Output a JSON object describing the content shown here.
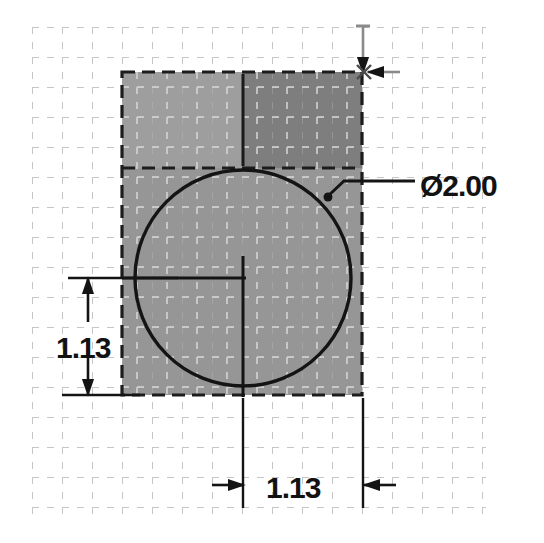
{
  "drawing": {
    "type": "cad-sketch",
    "title": "",
    "units": "inch",
    "background_color": "#ffffff",
    "grid": {
      "visible": true,
      "style": "dashed",
      "spacing_px": 30,
      "color": "#c9c9c9",
      "origin_x": 32,
      "origin_y": 27,
      "cols": 16,
      "rows": 17
    },
    "shapes": [
      {
        "name": "base-rectangle",
        "type": "rectangle",
        "x": 122,
        "y": 72,
        "width": 240,
        "height": 323,
        "edge_style": "dashed",
        "edge_color": "#1a1a1a",
        "bands": [
          {
            "name": "upper-left-band",
            "fill": "#9b9b9b",
            "x": 122,
            "y": 72,
            "width": 120,
            "height": 96
          },
          {
            "name": "upper-right-band",
            "fill": "#7d7d7d",
            "x": 242,
            "y": 72,
            "width": 120,
            "height": 96
          },
          {
            "name": "lower-band",
            "fill": "#949494",
            "x": 122,
            "y": 168,
            "width": 240,
            "height": 227
          }
        ]
      },
      {
        "name": "circle-hole",
        "type": "circle",
        "center_x": 243,
        "center_y": 278,
        "radius": 108,
        "stroke_color": "#141414",
        "stroke_width": 3,
        "fill": "none"
      },
      {
        "name": "center-mark",
        "type": "crosshair",
        "center_x": 243,
        "center_y": 278,
        "stroke_color": "#141414"
      }
    ],
    "dimensions": [
      {
        "name": "diameter-dimension",
        "label": "Ø2.00",
        "value": "2.00",
        "symbol": "Ø",
        "kind": "diameter",
        "leader": {
          "from_x": 327,
          "from_y": 196,
          "elbow_x": 343,
          "elbow_y": 182,
          "to_x": 415,
          "to_y": 182
        },
        "text_x": 421,
        "text_y": 194
      },
      {
        "name": "vertical-dimension",
        "label": "1.13",
        "value": "1.13",
        "kind": "linear-vertical",
        "line_x": 88,
        "from_y": 278,
        "to_y": 395,
        "arrows": "inward",
        "text_x": 59,
        "text_y": 348
      },
      {
        "name": "horizontal-dimension",
        "label": "1.13",
        "value": "1.13",
        "kind": "linear-horizontal",
        "line_y": 485,
        "from_x": 243,
        "to_x": 363,
        "arrows": "outward",
        "text_x": 268,
        "text_y": 497
      },
      {
        "name": "top-corner-extension",
        "kind": "extension-arrow",
        "vertical_x": 363,
        "vertical_from_y": 25,
        "vertical_to_y": 72,
        "horizontal_from_x": 399,
        "horizontal_to_x": 367,
        "horizontal_y": 72
      }
    ]
  }
}
